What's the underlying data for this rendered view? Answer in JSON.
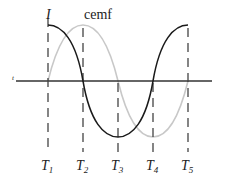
{
  "labels": {
    "current": "I",
    "cemf": "cemf",
    "time_axis": "t"
  },
  "time_markers": [
    {
      "main": "T",
      "sub": "1"
    },
    {
      "main": "T",
      "sub": "2"
    },
    {
      "main": "T",
      "sub": "3"
    },
    {
      "main": "T",
      "sub": "4"
    },
    {
      "main": "T",
      "sub": "5"
    }
  ],
  "colors": {
    "current_curve": "#1a1a1a",
    "cemf_curve": "#c8c8c8",
    "axis": "#333333",
    "dashes": "#444444"
  }
}
